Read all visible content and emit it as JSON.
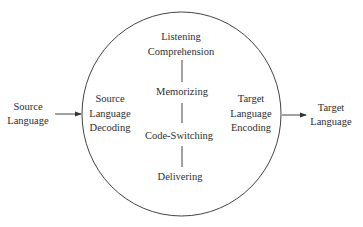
{
  "diagram": {
    "type": "process-circle",
    "input": {
      "lines": [
        "Source",
        "Language"
      ]
    },
    "output": {
      "lines": [
        "Target",
        "Language"
      ]
    },
    "circle": {
      "left": {
        "lines": [
          "Source",
          "Language",
          "Decoding"
        ]
      },
      "right": {
        "lines": [
          "Target",
          "Language",
          "Encoding"
        ]
      },
      "stages": [
        {
          "lines": [
            "Listening",
            "Comprehension"
          ]
        },
        {
          "lines": [
            "Memorizing"
          ]
        },
        {
          "lines": [
            "Code-Switching"
          ]
        },
        {
          "lines": [
            "Delivering"
          ]
        }
      ]
    },
    "edges": [
      {
        "from": "Source Language",
        "to": "Source Language Decoding",
        "style": "arrow"
      },
      {
        "from": "Target Language Encoding",
        "to": "Target Language",
        "style": "arrow"
      },
      {
        "from": "Listening Comprehension",
        "to": "Memorizing",
        "style": "line"
      },
      {
        "from": "Memorizing",
        "to": "Code-Switching",
        "style": "line"
      },
      {
        "from": "Code-Switching",
        "to": "Delivering",
        "style": "line"
      }
    ],
    "colors": {
      "stroke": "#444444",
      "text": "#2f2f2f",
      "background": "#ffffff"
    }
  }
}
